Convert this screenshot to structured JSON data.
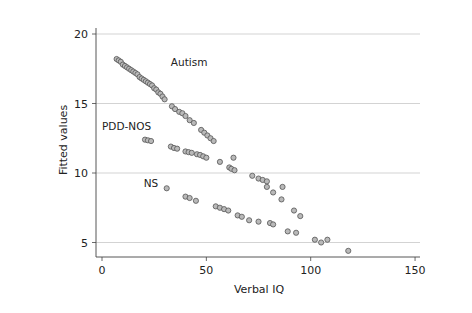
{
  "chart_data": {
    "type": "scatter",
    "title": "",
    "xlabel": "Verbal IQ",
    "ylabel": "Fitted values",
    "xlim": [
      0,
      150
    ],
    "ylim": [
      4,
      20.5
    ],
    "xticks": [
      0,
      50,
      100,
      150
    ],
    "yticks": [
      5,
      10,
      15,
      20
    ],
    "grid": "horizontal",
    "legend": "none",
    "annotations": [
      {
        "text": "Autism",
        "x": 33,
        "y": 17.7
      },
      {
        "text": "PDD-NOS",
        "x": 0,
        "y": 13.1
      },
      {
        "text": "NS",
        "x": 20,
        "y": 9.0
      }
    ],
    "series": [
      {
        "name": "Autism",
        "points": [
          [
            7,
            18.2
          ],
          [
            8,
            18.1
          ],
          [
            9,
            18.0
          ],
          [
            10,
            17.8
          ],
          [
            11,
            17.7
          ],
          [
            12,
            17.6
          ],
          [
            13,
            17.5
          ],
          [
            14,
            17.4
          ],
          [
            15,
            17.3
          ],
          [
            16,
            17.2
          ],
          [
            17,
            17.1
          ],
          [
            18,
            16.9
          ],
          [
            19,
            16.8
          ],
          [
            20,
            16.7
          ],
          [
            21,
            16.6
          ],
          [
            22,
            16.5
          ],
          [
            23,
            16.4
          ],
          [
            24,
            16.3
          ],
          [
            25,
            16.1
          ],
          [
            26,
            16.0
          ],
          [
            27,
            15.8
          ],
          [
            28,
            15.7
          ],
          [
            29,
            15.5
          ],
          [
            30,
            15.3
          ],
          [
            33.5,
            14.8
          ],
          [
            35,
            14.6
          ],
          [
            37,
            14.4
          ],
          [
            38.5,
            14.3
          ],
          [
            40,
            14.1
          ],
          [
            42,
            13.8
          ],
          [
            44,
            13.6
          ],
          [
            47.5,
            13.1
          ],
          [
            49,
            12.9
          ],
          [
            50.5,
            12.7
          ],
          [
            52,
            12.5
          ],
          [
            53.5,
            12.3
          ]
        ]
      },
      {
        "name": "PDD-NOS",
        "points": [
          [
            20.6,
            12.4
          ],
          [
            22,
            12.35
          ],
          [
            23.5,
            12.3
          ],
          [
            33,
            11.9
          ],
          [
            34.5,
            11.8
          ],
          [
            36,
            11.75
          ],
          [
            40,
            11.55
          ],
          [
            41.5,
            11.5
          ],
          [
            43,
            11.45
          ],
          [
            45.5,
            11.35
          ],
          [
            47,
            11.3
          ],
          [
            48.5,
            11.2
          ],
          [
            50,
            11.1
          ],
          [
            56.5,
            10.8
          ],
          [
            61,
            10.4
          ],
          [
            62,
            10.3
          ],
          [
            63.5,
            10.2
          ],
          [
            63,
            11.1
          ],
          [
            72,
            9.8
          ],
          [
            75,
            9.6
          ],
          [
            77,
            9.5
          ],
          [
            79,
            9.4
          ],
          [
            79,
            9.0
          ],
          [
            82,
            8.6
          ],
          [
            86.5,
            9.0
          ],
          [
            86,
            8.1
          ],
          [
            92,
            7.3
          ],
          [
            95,
            6.9
          ]
        ]
      },
      {
        "name": "NS",
        "points": [
          [
            31,
            8.9
          ],
          [
            40,
            8.3
          ],
          [
            42,
            8.2
          ],
          [
            45,
            8.0
          ],
          [
            54.5,
            7.6
          ],
          [
            56.5,
            7.5
          ],
          [
            58.5,
            7.4
          ],
          [
            60.5,
            7.3
          ],
          [
            65,
            6.95
          ],
          [
            67,
            6.85
          ],
          [
            70.5,
            6.6
          ],
          [
            75,
            6.5
          ],
          [
            80.5,
            6.4
          ],
          [
            82,
            6.3
          ],
          [
            89,
            5.8
          ],
          [
            93,
            5.7
          ],
          [
            102,
            5.2
          ],
          [
            105,
            5.0
          ],
          [
            108,
            5.2
          ],
          [
            118,
            4.4
          ]
        ]
      }
    ]
  }
}
